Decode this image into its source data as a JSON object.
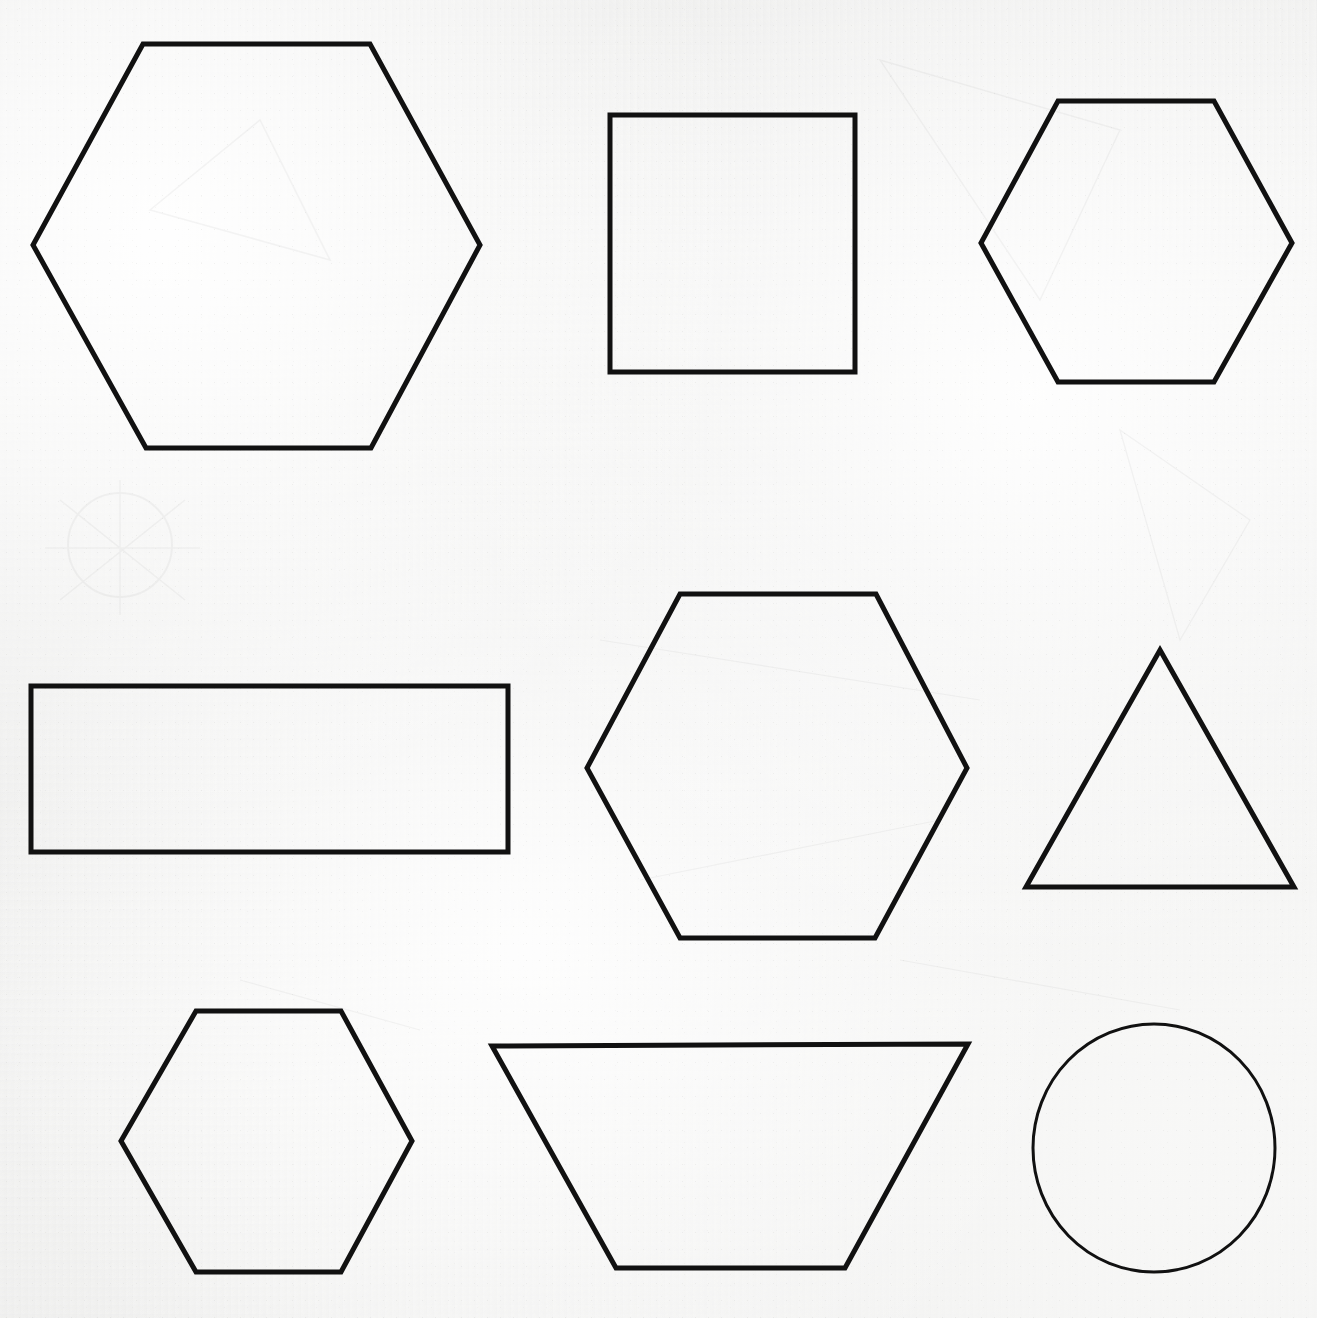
{
  "page": {
    "width": 1317,
    "height": 1318,
    "background_color": "#f4f4f3",
    "ink_color": "#111111",
    "medium": "scanned paper print",
    "shape_count": 9,
    "grid_rows": 3,
    "grid_columns": 3
  },
  "shapes": [
    {
      "id": "shape-1",
      "name": "hexagon-large",
      "type": "hexagon",
      "row": 1,
      "column": 1,
      "orientation": "flat-top",
      "stroke_width": 5,
      "bbox": {
        "x": 33,
        "y": 44,
        "width": 447,
        "height": 404
      },
      "center": {
        "x": 256,
        "y": 246
      },
      "points": "143,44 370,44 480,245 371,448 146,448 33,245"
    },
    {
      "id": "shape-2",
      "name": "square",
      "type": "square",
      "row": 1,
      "column": 2,
      "orientation": "upright",
      "stroke_width": 5,
      "bbox": {
        "x": 610,
        "y": 115,
        "width": 245,
        "height": 257
      },
      "center": {
        "x": 732,
        "y": 243
      },
      "points": "610,115 855,115 855,372 610,372"
    },
    {
      "id": "shape-3",
      "name": "hexagon-top-right",
      "type": "hexagon",
      "row": 1,
      "column": 3,
      "orientation": "flat-top",
      "stroke_width": 5,
      "bbox": {
        "x": 981,
        "y": 101,
        "width": 311,
        "height": 281
      },
      "center": {
        "x": 1136,
        "y": 242
      },
      "points": "1058,101 1214,101 1292,243 1214,382 1058,382 981,243"
    },
    {
      "id": "shape-4",
      "name": "rectangle-wide",
      "type": "rectangle",
      "row": 2,
      "column": 1,
      "orientation": "landscape",
      "stroke_width": 5,
      "bbox": {
        "x": 31,
        "y": 686,
        "width": 477,
        "height": 166
      },
      "center": {
        "x": 269,
        "y": 769
      },
      "points": "31,686 508,686 508,852 31,852"
    },
    {
      "id": "shape-5",
      "name": "hexagon-middle",
      "type": "hexagon",
      "row": 2,
      "column": 2,
      "orientation": "flat-top",
      "stroke_width": 5,
      "bbox": {
        "x": 587,
        "y": 594,
        "width": 380,
        "height": 344
      },
      "center": {
        "x": 777,
        "y": 766
      },
      "points": "680,594 876,594 967,768 875,938 680,938 587,768"
    },
    {
      "id": "shape-6",
      "name": "triangle",
      "type": "triangle",
      "row": 2,
      "column": 3,
      "orientation": "equilateral-upright",
      "stroke_width": 5,
      "bbox": {
        "x": 1026,
        "y": 650,
        "width": 268,
        "height": 237
      },
      "center": {
        "x": 1160,
        "y": 808
      },
      "points": "1160,650 1294,887 1026,887"
    },
    {
      "id": "shape-7",
      "name": "hexagon-bottom-left",
      "type": "hexagon",
      "row": 3,
      "column": 1,
      "orientation": "flat-top",
      "stroke_width": 5,
      "bbox": {
        "x": 121,
        "y": 1011,
        "width": 291,
        "height": 261
      },
      "center": {
        "x": 266,
        "y": 1141
      },
      "points": "196,1011 341,1011 412,1141 341,1272 196,1272 121,1141"
    },
    {
      "id": "shape-8",
      "name": "trapezoid",
      "type": "trapezoid",
      "row": 3,
      "column": 2,
      "orientation": "inverted-wider-top",
      "stroke_width": 5,
      "bbox": {
        "x": 492,
        "y": 1044,
        "width": 476,
        "height": 224
      },
      "center": {
        "x": 730,
        "y": 1150
      },
      "points": "492,1046 968,1044 845,1268 616,1268"
    },
    {
      "id": "shape-9",
      "name": "circle",
      "type": "circle",
      "row": 3,
      "column": 3,
      "orientation": "n/a",
      "stroke_width": 3,
      "bbox": {
        "x": 1033,
        "y": 1024,
        "width": 243,
        "height": 248
      },
      "center": {
        "x": 1154,
        "y": 1148
      },
      "radius_x": 121,
      "radius_y": 124
    }
  ],
  "chart_data": {
    "type": "table",
    "categories": [
      "hexagon",
      "square",
      "rectangle",
      "triangle",
      "trapezoid",
      "circle"
    ],
    "values": [
      4,
      1,
      1,
      1,
      1,
      1
    ],
    "xlabel": "shape type",
    "ylabel": "count"
  }
}
